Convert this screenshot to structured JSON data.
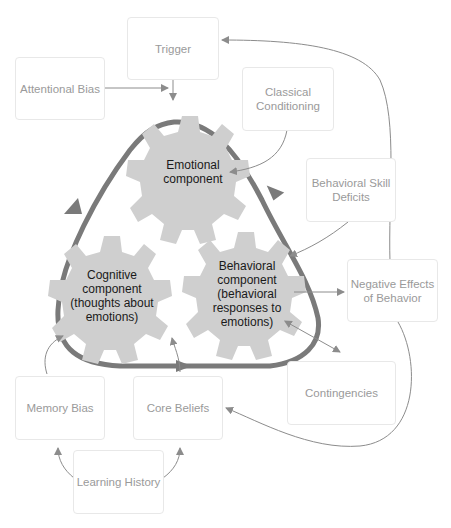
{
  "boxes": {
    "trigger": "Trigger",
    "attentional_bias": "Attentional Bias",
    "classical_conditioning": "Classical Conditioning",
    "behavioral_skill_deficits": "Behavioral Skill Deficits",
    "negative_effects": "Negative Effects of Behavior",
    "contingencies": "Contingencies",
    "memory_bias": "Memory Bias",
    "core_beliefs": "Core Beliefs",
    "learning_history": "Learning History"
  },
  "gears": {
    "emotional": "Emotional component",
    "cognitive": "Cognitive component (thoughts about emotions)",
    "behavioral": "Behavioral component (behavioral responses to emotions)"
  },
  "colors": {
    "cycle": "#7a7a7a",
    "gear_fill": "#cfcfcf",
    "gear_shadow": "#8a8a8a",
    "box_text": "#9a9a9a",
    "arrow": "#8c8c8c"
  }
}
